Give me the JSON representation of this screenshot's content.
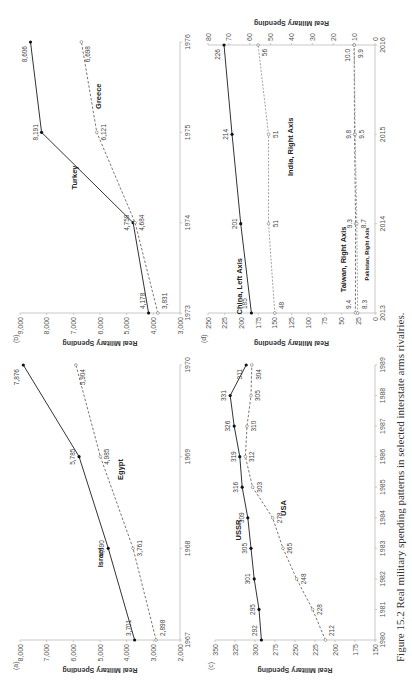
{
  "caption": "Figure 15.2  Real military spending patterns in selected interstate arms rivalries.",
  "chart_data": [
    {
      "panel": "(a)",
      "type": "line",
      "title": "",
      "xlabel": "",
      "ylabel": "Real Military Spending",
      "x": [
        "1967",
        "1968",
        "1969",
        "1970"
      ],
      "ylim": [
        2000,
        8000
      ],
      "yticks": [
        "2,000",
        "3,000",
        "4,000",
        "5,000",
        "6,000",
        "7,000",
        "8,000"
      ],
      "series": [
        {
          "name": "Israel",
          "style": "solid",
          "values": [
            3701,
            4690,
            5785,
            7876
          ],
          "labels": [
            "3,701",
            "4,690",
            "5,785",
            "7,876"
          ]
        },
        {
          "name": "Egypt",
          "style": "dashed",
          "values": [
            2898,
            3761,
            4985,
            5904
          ],
          "labels": [
            "2,898",
            "3,761",
            "4,985",
            "5,904"
          ]
        }
      ],
      "grid": false
    },
    {
      "panel": "(b)",
      "type": "line",
      "title": "",
      "xlabel": "",
      "ylabel": "Real Military Spending",
      "x": [
        "1973",
        "1974",
        "1975",
        "1976"
      ],
      "ylim": [
        3000,
        9000
      ],
      "yticks": [
        "3,000",
        "4,000",
        "5,000",
        "6,000",
        "7,000",
        "8,000",
        "9,000"
      ],
      "series": [
        {
          "name": "Turkey",
          "style": "solid",
          "values": [
            4178,
            4758,
            8191,
            8606
          ],
          "labels": [
            "4,178",
            "4,758",
            "8,191",
            "8,606"
          ]
        },
        {
          "name": "Greece",
          "style": "dashed",
          "values": [
            3831,
            4684,
            6121,
            6698
          ],
          "labels": [
            "3,831",
            "4,684",
            "6,121",
            "6,698"
          ]
        }
      ],
      "grid": false
    },
    {
      "panel": "(c)",
      "type": "line",
      "title": "",
      "xlabel": "",
      "ylabel": "Real Military Spending",
      "x": [
        "1980",
        "1981",
        "1982",
        "1983",
        "1984",
        "1985",
        "1986",
        "1987",
        "1988",
        "1989"
      ],
      "ylim": [
        150,
        350
      ],
      "yticks": [
        "150",
        "175",
        "200",
        "225",
        "250",
        "275",
        "300",
        "325",
        "350"
      ],
      "series": [
        {
          "name": "USSR",
          "style": "solid",
          "values": [
            292,
            295,
            301,
            305,
            309,
            316,
            319,
            326,
            331,
            311
          ]
        },
        {
          "name": "USA",
          "style": "dashed",
          "values": [
            212,
            228,
            248,
            265,
            278,
            303,
            312,
            310,
            305,
            304
          ]
        }
      ],
      "grid": false
    },
    {
      "panel": "(d)",
      "type": "line",
      "title": "",
      "xlabel": "",
      "ylabel": "Real Military Spending",
      "ylabel_right": "Real Military Spending",
      "x": [
        "2013",
        "2014",
        "2015",
        "2016"
      ],
      "ylim": [
        0,
        250
      ],
      "ylim_right": [
        0,
        80
      ],
      "yticks": [
        "0",
        "25",
        "50",
        "75",
        "100",
        "125",
        "150",
        "175",
        "200",
        "225",
        "250"
      ],
      "yticks_right": [
        "0",
        "10",
        "20",
        "30",
        "40",
        "50",
        "60",
        "70",
        "80"
      ],
      "series": [
        {
          "name": "China, Left Axis",
          "axis": "left",
          "style": "solid",
          "values": [
            185,
            201,
            214,
            226
          ]
        },
        {
          "name": "India, Right Axis",
          "axis": "right",
          "style": "dotted-light",
          "values": [
            48,
            51,
            51,
            56
          ]
        },
        {
          "name": "Taiwan, Right Axis",
          "axis": "right",
          "style": "dashed",
          "values": [
            9.4,
            9.3,
            9.8,
            10.0
          ],
          "labels": [
            "9.4",
            "9.3",
            "9.8",
            "10.0"
          ]
        },
        {
          "name": "Pakistan, Right Axis",
          "axis": "right",
          "style": "dotted-light",
          "values": [
            8.3,
            8.7,
            9.5,
            9.9
          ],
          "labels": [
            "8.3",
            "8.7",
            "9.5",
            "9.9"
          ]
        }
      ],
      "grid": false
    }
  ]
}
